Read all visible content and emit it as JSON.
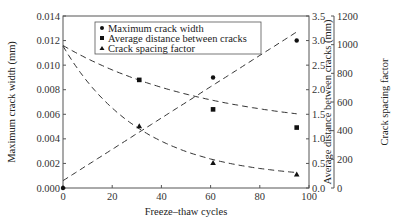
{
  "chart_data": {
    "type": "scatter",
    "title": "",
    "xlabel": "Freeze–thaw cycles",
    "xlim": [
      0,
      100
    ],
    "xticks": [
      0,
      20,
      40,
      60,
      80,
      100
    ],
    "axes": [
      {
        "side": "left",
        "label": "Maximum crack width (mm)",
        "ylim": [
          0,
          0.014
        ],
        "ticks": [
          "0.000",
          "0.002",
          "0.004",
          "0.006",
          "0.008",
          "0.010",
          "0.012",
          "0.014"
        ]
      },
      {
        "side": "right",
        "label": "Average distance between cracks (mm)",
        "ylim": [
          0,
          3.5
        ],
        "ticks": [
          "0.0",
          "0.5",
          "1.0",
          "1.5",
          "2.0",
          "2.5",
          "3.0",
          "3.5"
        ]
      },
      {
        "side": "right-outer",
        "label": "Crack spacing factor",
        "ylim": [
          0,
          1200
        ],
        "ticks": [
          "0",
          "200",
          "400",
          "600",
          "800",
          "1000",
          "1200"
        ]
      }
    ],
    "series": [
      {
        "name": "Maximum crack width",
        "marker": "circle",
        "axis": "left",
        "x": [
          0,
          61,
          95
        ],
        "y": [
          0.0,
          0.009,
          0.012
        ],
        "trend": "linear dashed from ~0.0006 at 0 to ~0.0127 at 95"
      },
      {
        "name": "Average distance between cracks",
        "marker": "square",
        "axis": "right",
        "x": [
          31,
          61,
          95
        ],
        "y": [
          2.2,
          1.6,
          1.23
        ],
        "trend": "dashed decreasing from ~2.9 at 0"
      },
      {
        "name": "Crack spacing factor",
        "marker": "triangle",
        "axis": "right-outer",
        "x": [
          31,
          61,
          95
        ],
        "y": [
          430,
          175,
          95
        ],
        "trend": "dashed exponential decay from ~990 at 0"
      }
    ],
    "legend": {
      "position": "upper-left-inside",
      "entries": [
        "Maximum crack width",
        "Average distance between cracks",
        "Crack spacing factor"
      ]
    },
    "grid": false
  }
}
